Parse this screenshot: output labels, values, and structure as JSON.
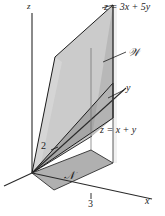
{
  "figure": {
    "type": "3d-solid-region-diagram",
    "background_color": "#ffffff",
    "axes": {
      "x_label": "x",
      "y_label": "y",
      "z_label": "z"
    },
    "ticks": {
      "y_tick_label": "2",
      "x_tick_label": "3"
    },
    "labels": {
      "top_plane_equation": "z = 3x + 5y",
      "bottom_plane_equation": "z = x + y",
      "solid_region": "𝒲",
      "domain_region": "𝒩"
    },
    "colors": {
      "line": "#1c1c1c",
      "axis": "#2a2a2a",
      "top_plane_fill": "#c9c9c9",
      "mid_plane_fill": "#a8a8a8",
      "side_fill": "#b8b8b8",
      "domain_fill": "#b0b0b0",
      "light_fill": "#d8d8d8"
    }
  }
}
